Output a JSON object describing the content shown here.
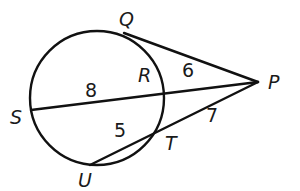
{
  "diagram": {
    "type": "geometry-circle-secant-tangent",
    "colors": {
      "stroke": "#111111",
      "text": "#1a1a1a",
      "background": "#ffffff"
    },
    "circle": {
      "cx": 97,
      "cy": 98,
      "r": 67
    },
    "points": {
      "Q": {
        "label": "Q",
        "x": 127,
        "y": 32
      },
      "P": {
        "label": "P",
        "x": 258,
        "y": 82
      },
      "R": {
        "label": "R",
        "x": 163,
        "y": 87
      },
      "S": {
        "label": "S",
        "x": 31,
        "y": 110
      },
      "T": {
        "label": "T",
        "x": 157,
        "y": 129
      },
      "U": {
        "label": "U",
        "x": 90,
        "y": 165
      }
    },
    "segments": [
      {
        "name": "tangent-PQ",
        "from": "P",
        "to": "Q"
      },
      {
        "name": "secant-PS",
        "from": "P",
        "to": "S"
      },
      {
        "name": "secant-PU",
        "from": "P",
        "to": "U"
      }
    ],
    "lengths": {
      "SR": "8",
      "RP": "6",
      "UT": "5",
      "TP": "7"
    }
  }
}
